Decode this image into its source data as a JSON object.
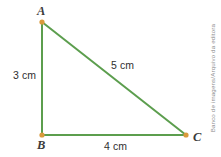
{
  "figure": {
    "type": "right-triangle-diagram",
    "background_color": "#ffffff",
    "stroke_color": "#5c9e4e",
    "vertex_dot_color": "#d99a3c",
    "label_color": "#3b3b3b",
    "measure_color": "#2f2f2f",
    "credit_color": "#8e8e8e"
  },
  "vertices": [
    {
      "name": "A",
      "label": "A",
      "x": 42,
      "y": 22
    },
    {
      "name": "B",
      "label": "B",
      "x": 42,
      "y": 135
    },
    {
      "name": "C",
      "label": "C",
      "x": 186,
      "y": 135
    }
  ],
  "sides": [
    {
      "name": "AB",
      "label": "3 cm",
      "value": 3,
      "unit": "cm"
    },
    {
      "name": "AC",
      "label": "5 cm",
      "value": 5,
      "unit": "cm"
    },
    {
      "name": "BC",
      "label": "4 cm",
      "value": 4,
      "unit": "cm"
    }
  ],
  "credit": {
    "text": "Banco de imagens/Arquivo da editora"
  }
}
